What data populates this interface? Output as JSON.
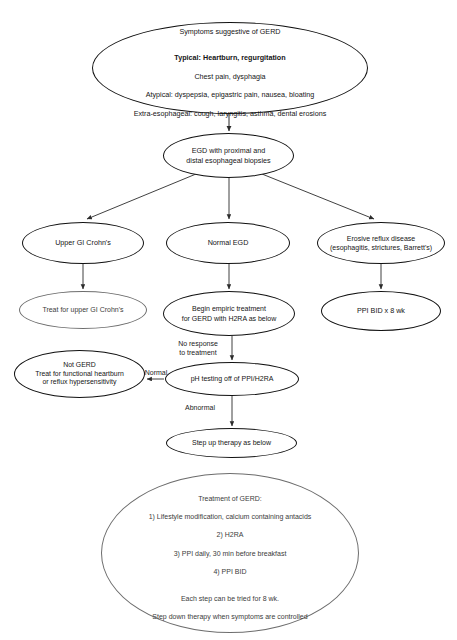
{
  "diagram": {
    "stroke_color": "#111111",
    "thin_stroke_color": "#6d6d6d",
    "background": "#ffffff"
  },
  "nodes": {
    "symptoms": {
      "lead": "Symptoms suggestive of GERD",
      "typical": "Typical: Heartburn, regurgitation",
      "line2": "Chest pain, dysphagia",
      "line3": "Atypical: dyspepsia, epigastric pain, nausea, bloating",
      "line4": "Extra-esophageal: cough, laryngitis, asthma, dental erosions"
    },
    "egd": "EGD with proximal and\ndistal esophageal biopsies",
    "upper_gi_crohns": "Upper GI Crohn's",
    "normal_egd": "Normal EGD",
    "erosive": "Erosive reflux disease\n(esophagitis, strictures, Barrett's)",
    "treat_crohns": "Treat for upper GI Crohn's",
    "empiric": "Begin empiric treatment\nfor GERD with H2RA as below",
    "ppi_8wk": "PPI BID x 8 wk",
    "not_gerd": "Not GERD\nTreat for functional heartburn\nor reflux hypersensitivity",
    "ph_testing": "pH testing off of PPI/H2RA",
    "step_up": "Step up therapy as below",
    "treatment_box": {
      "heading": "Treatment of GERD:",
      "step1": "1) Lifestyle modification, calcium containing antacids",
      "step2": "2) H2RA",
      "step3": "3) PPI daily, 30 min before breakfast",
      "step4": "4) PPI BID",
      "note1": "Each step can be tried for 8 wk.",
      "note2": "Step down therapy when symptoms are controlled"
    }
  },
  "edge_labels": {
    "no_response": "No response\nto treatment",
    "normal": "Normal",
    "abnormal": "Abnormal"
  }
}
